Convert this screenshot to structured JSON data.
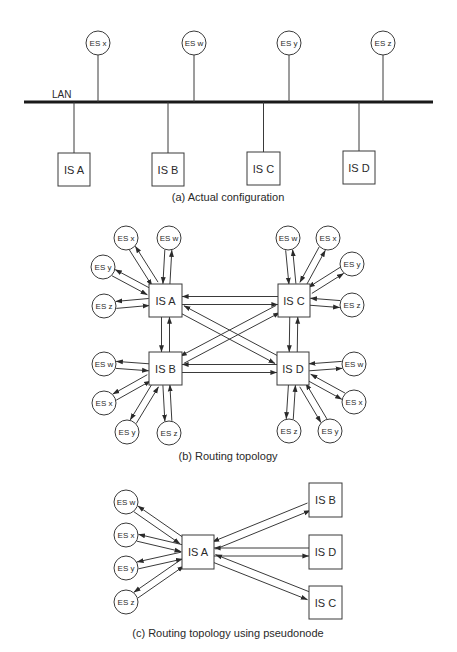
{
  "colors": {
    "stroke": "#3a3a3a",
    "text": "#2a2a2a",
    "background": "#ffffff"
  },
  "panel_a": {
    "caption": "(a)  Actual configuration",
    "caption_pos": [
      228,
      201
    ],
    "lan": {
      "label": "LAN",
      "label_pos": [
        52,
        98
      ],
      "x1": 24,
      "x2": 433,
      "y": 102
    },
    "end_systems": [
      {
        "id": "es-x",
        "label": "ES x",
        "cx": 98,
        "cy": 43
      },
      {
        "id": "es-w",
        "label": "ES w",
        "cx": 194,
        "cy": 43
      },
      {
        "id": "es-y",
        "label": "ES y",
        "cx": 289,
        "cy": 43
      },
      {
        "id": "es-z",
        "label": "ES z",
        "cx": 383,
        "cy": 43
      }
    ],
    "intermediate_systems": [
      {
        "id": "is-a",
        "label": "IS A",
        "x": 58,
        "y": 153,
        "w": 32,
        "h": 33
      },
      {
        "id": "is-b",
        "label": "IS B",
        "x": 152,
        "y": 153,
        "w": 32,
        "h": 33
      },
      {
        "id": "is-c",
        "label": "IS C",
        "x": 247,
        "y": 152,
        "w": 33,
        "h": 33
      },
      {
        "id": "is-d",
        "label": "IS D",
        "x": 343,
        "y": 151,
        "w": 32,
        "h": 33
      }
    ]
  },
  "panel_b": {
    "caption": "(b)  Routing topology",
    "caption_pos": [
      228,
      460
    ],
    "intermediate_systems": [
      {
        "id": "is-a",
        "label": "IS A",
        "x": 149,
        "y": 284,
        "w": 33,
        "h": 33
      },
      {
        "id": "is-c",
        "label": "IS C",
        "x": 278,
        "y": 284,
        "w": 32,
        "h": 33
      },
      {
        "id": "is-b",
        "label": "IS B",
        "x": 149,
        "y": 352,
        "w": 33,
        "h": 33
      },
      {
        "id": "is-d",
        "label": "IS D",
        "x": 277,
        "y": 352,
        "w": 32,
        "h": 33
      }
    ],
    "end_systems": [
      {
        "id": "a-es-x",
        "label": "ES x",
        "cx": 126,
        "cy": 238,
        "is": "is-a"
      },
      {
        "id": "a-es-w",
        "label": "ES w",
        "cx": 169,
        "cy": 238,
        "is": "is-a"
      },
      {
        "id": "a-es-y",
        "label": "ES y",
        "cx": 103,
        "cy": 267,
        "is": "is-a"
      },
      {
        "id": "a-es-z",
        "label": "ES z",
        "cx": 104,
        "cy": 306,
        "is": "is-a"
      },
      {
        "id": "c-es-w",
        "label": "ES w",
        "cx": 288,
        "cy": 238,
        "is": "is-c"
      },
      {
        "id": "c-es-x",
        "label": "ES x",
        "cx": 328,
        "cy": 238,
        "is": "is-c"
      },
      {
        "id": "c-es-y",
        "label": "ES y",
        "cx": 352,
        "cy": 264,
        "is": "is-c"
      },
      {
        "id": "c-es-z",
        "label": "ES z",
        "cx": 352,
        "cy": 305,
        "is": "is-c"
      },
      {
        "id": "b-es-w",
        "label": "ES w",
        "cx": 104,
        "cy": 364,
        "is": "is-b"
      },
      {
        "id": "b-es-x",
        "label": "ES x",
        "cx": 104,
        "cy": 403,
        "is": "is-b"
      },
      {
        "id": "b-es-y",
        "label": "ES y",
        "cx": 127,
        "cy": 432,
        "is": "is-b"
      },
      {
        "id": "b-es-z",
        "label": "ES z",
        "cx": 169,
        "cy": 433,
        "is": "is-b"
      },
      {
        "id": "d-es-w",
        "label": "ES w",
        "cx": 354,
        "cy": 364,
        "is": "is-d"
      },
      {
        "id": "d-es-x",
        "label": "ES x",
        "cx": 354,
        "cy": 402,
        "is": "is-d"
      },
      {
        "id": "d-es-y",
        "label": "ES y",
        "cx": 330,
        "cy": 431,
        "is": "is-d"
      },
      {
        "id": "d-es-z",
        "label": "ES z",
        "cx": 289,
        "cy": 431,
        "is": "is-d"
      }
    ],
    "is_links": [
      [
        "is-a",
        "is-c"
      ],
      [
        "is-a",
        "is-b"
      ],
      [
        "is-a",
        "is-d"
      ],
      [
        "is-c",
        "is-b"
      ],
      [
        "is-c",
        "is-d"
      ],
      [
        "is-b",
        "is-d"
      ]
    ]
  },
  "panel_c": {
    "caption": "(c)  Routing topology using pseudonode",
    "caption_pos": [
      228,
      637
    ],
    "hub": {
      "id": "is-a",
      "label": "IS A",
      "x": 182,
      "y": 535,
      "w": 32,
      "h": 34
    },
    "end_systems": [
      {
        "id": "es-w",
        "label": "ES w",
        "cx": 126,
        "cy": 502
      },
      {
        "id": "es-x",
        "label": "ES x",
        "cx": 126,
        "cy": 535
      },
      {
        "id": "es-y",
        "label": "ES y",
        "cx": 126,
        "cy": 568
      },
      {
        "id": "es-z",
        "label": "ES z",
        "cx": 126,
        "cy": 602
      }
    ],
    "intermediate_systems": [
      {
        "id": "is-b",
        "label": "IS B",
        "x": 309,
        "y": 483,
        "w": 33,
        "h": 34
      },
      {
        "id": "is-d",
        "label": "IS D",
        "x": 309,
        "y": 535,
        "w": 33,
        "h": 34
      },
      {
        "id": "is-c",
        "label": "IS C",
        "x": 309,
        "y": 586,
        "w": 33,
        "h": 33
      }
    ]
  }
}
